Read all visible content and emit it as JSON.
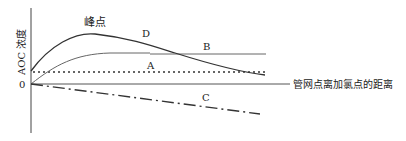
{
  "diagram": {
    "y_axis_label": "AOC 浓度",
    "x_axis_label": "管网点离加氯点的距离",
    "origin_label": "0",
    "peak_label": "峰点",
    "curves": [
      {
        "id": "A",
        "label": "A",
        "style": "solid-thin",
        "description": "rises from origin and levels off"
      },
      {
        "id": "B",
        "label": "B",
        "style": "solid-thin",
        "description": "horizontal plateau line"
      },
      {
        "id": "C",
        "label": "C",
        "style": "dash-dot",
        "description": "declines from origin"
      },
      {
        "id": "D",
        "label": "D",
        "style": "solid",
        "description": "rises to peak then declines"
      },
      {
        "id": "baseline",
        "label": "",
        "style": "dotted",
        "description": "initial AOC level"
      }
    ],
    "colors": {
      "line": "#333333",
      "background": "#ffffff"
    }
  }
}
